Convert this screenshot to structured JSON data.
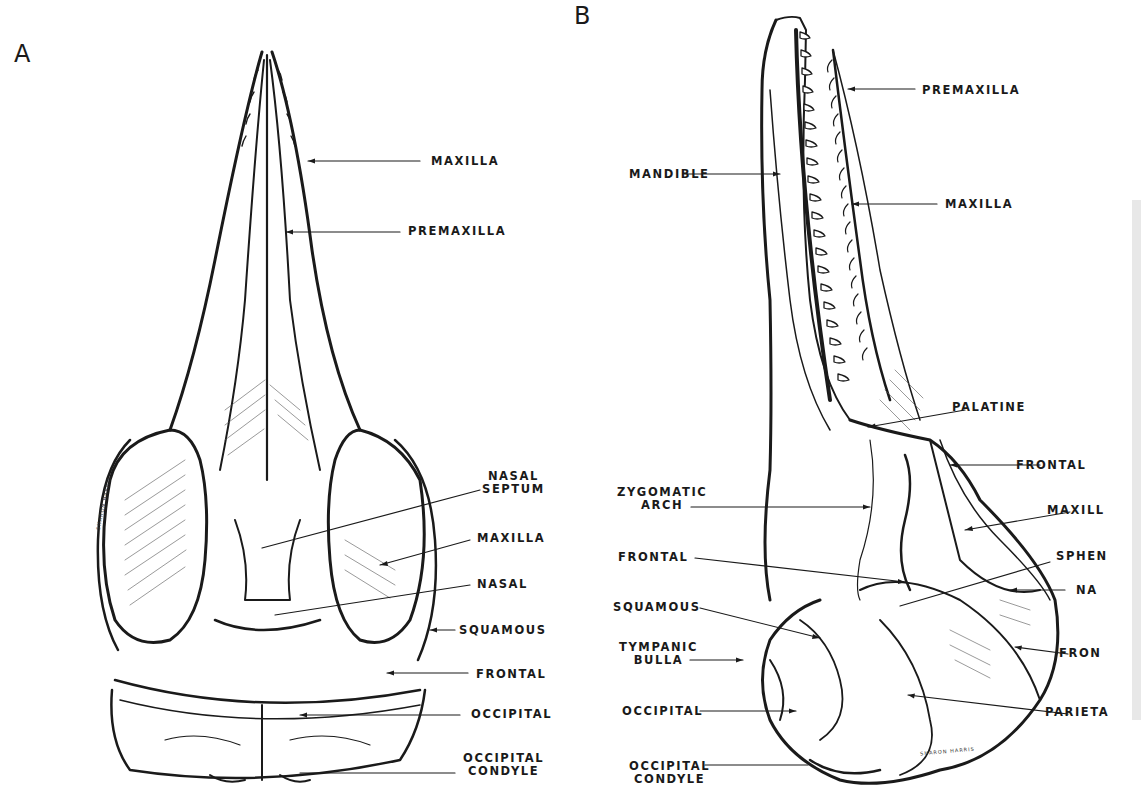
{
  "figure": {
    "panels": [
      {
        "id": "A",
        "letter": "A",
        "view": "dorsal view of dolphin skull",
        "labels": [
          {
            "text": "MAXILLA"
          },
          {
            "text": "PREMAXILLA"
          },
          {
            "line1": "NASAL",
            "line2": "SEPTUM"
          },
          {
            "text": "MAXILLA"
          },
          {
            "text": "NASAL"
          },
          {
            "text": "SQUAMOUS"
          },
          {
            "text": "FRONTAL"
          },
          {
            "text": "OCCIPITAL"
          },
          {
            "line1": "OCCIPITAL",
            "line2": "CONDYLE"
          }
        ],
        "signature": "SHARON HARRIS"
      },
      {
        "id": "B",
        "letter": "B",
        "view": "lateral view of dolphin skull",
        "labels_left": [
          {
            "text": "MANDIBLE"
          },
          {
            "line1": "ZYGOMATIC",
            "line2": "ARCH"
          },
          {
            "text": "FRONTAL"
          },
          {
            "text": "SQUAMOUS"
          },
          {
            "line1": "TYMPANIC",
            "line2": "BULLA"
          },
          {
            "text": "OCCIPITAL"
          },
          {
            "line1": "OCCIPITAL",
            "line2": "CONDYLE"
          }
        ],
        "labels_right": [
          {
            "text": "PREMAXILLA"
          },
          {
            "text": "MAXILLA"
          },
          {
            "text": "PALATINE"
          },
          {
            "text": "FRONTAL"
          },
          {
            "text": "MAXILL"
          },
          {
            "text": "SPHEN"
          },
          {
            "text": "NA"
          },
          {
            "text": "FRON"
          },
          {
            "text": "PARIETA"
          }
        ],
        "signature": "SHARON HARRIS"
      }
    ],
    "colors": {
      "ink": "#1a1a1a",
      "paper": "#ffffff"
    }
  }
}
